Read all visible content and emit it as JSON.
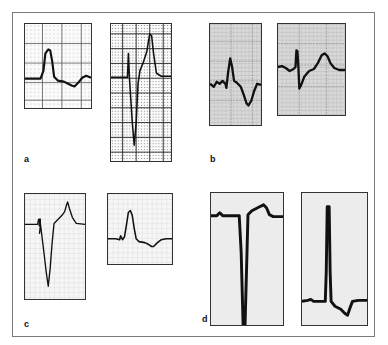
{
  "figure": {
    "labels": {
      "a": "a",
      "b": "b",
      "c": "c",
      "d": "d"
    },
    "colors": {
      "trace": "#111111",
      "frame": "#7a7a7a",
      "grid_gray_bg": "#d9d9d9",
      "plain_bg": "#ececec"
    },
    "panels": [
      {
        "id": "a1",
        "group": "a",
        "content": "tall peaked R wave with ST depression and shallow negative wave"
      },
      {
        "id": "a2",
        "group": "a",
        "content": "small r, deep S wave, tall peaked T wave on dense grid"
      },
      {
        "id": "b1",
        "group": "b",
        "content": "notched QRS with tall R and deep negative T wave on gray grid"
      },
      {
        "id": "b2",
        "group": "b",
        "content": "narrow R, S wave, upright rounded T wave on gray grid"
      },
      {
        "id": "c1",
        "group": "c",
        "content": "deep QS complex with tall T wave"
      },
      {
        "id": "c2",
        "group": "c",
        "content": "upright R wave with shallow negative T wave"
      },
      {
        "id": "d1",
        "group": "d",
        "content": "very deep QS complex with upright T wave"
      },
      {
        "id": "d2",
        "group": "d",
        "content": "very tall narrow R wave with negative T wave"
      }
    ]
  }
}
